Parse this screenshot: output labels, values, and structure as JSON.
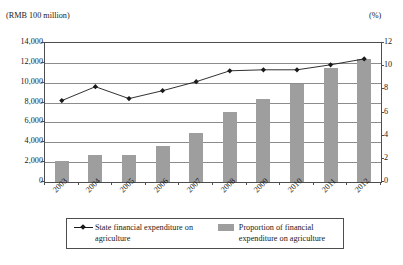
{
  "axes": {
    "left_unit_label": "(RMB 100 million)",
    "right_unit_label": "(%)",
    "left_ticks": [
      "14,000",
      "12,000",
      "10,000",
      "8,000",
      "6,000",
      "4,000",
      "2,000",
      "0"
    ],
    "right_ticks": [
      "12",
      "10",
      "8",
      "6",
      "4",
      "2",
      "0"
    ]
  },
  "legend": {
    "line_label": "State financial expenditure on agriculture",
    "bar_label": "Proportion of financial expenditure on agriculture",
    "line_swatch": "line-marker-swatch",
    "bar_swatch": "bar-color-swatch"
  },
  "colors": {
    "bar_fill": "#9e9e9e",
    "line_stroke": "#1a1a1a",
    "gridline": "#8c8c8c",
    "frame": "#4d4d4d"
  },
  "chart_data": {
    "type": "bar",
    "title": "",
    "subtitle": "",
    "xlabel": "",
    "ylabel": "(RMB 100 million)",
    "y2label": "(%)",
    "categories": [
      "2003",
      "2004",
      "2005",
      "2006",
      "2007",
      "2008",
      "2009",
      "2010",
      "2011",
      "2012"
    ],
    "ylim": [
      0,
      14000
    ],
    "y2lim": [
      0,
      12
    ],
    "ytick_step": 2000,
    "y2tick_step": 2,
    "grid": true,
    "legend_position": "bottom",
    "series": [
      {
        "name": "State financial expenditure on agriculture",
        "type": "line",
        "axis": "left",
        "unit": "RMB 100 million",
        "marker": "diamond",
        "values": [
          8200,
          9600,
          8400,
          9200,
          10100,
          11200,
          11300,
          11300,
          11800,
          12400
        ]
      },
      {
        "name": "Proportion of financial expenditure on agriculture",
        "type": "bar",
        "axis": "right",
        "unit": "%",
        "values": [
          1.8,
          2.3,
          2.3,
          3.1,
          4.2,
          6.0,
          7.2,
          8.5,
          9.8,
          10.6
        ]
      }
    ]
  }
}
